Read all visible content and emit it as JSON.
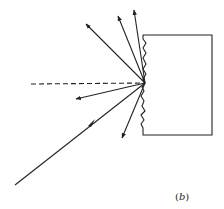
{
  "figure": {
    "label": "(b)",
    "label_open": "(",
    "label_letter": "b",
    "label_close": ")",
    "ink_color": "#222222",
    "background_color": "#ffffff"
  },
  "elements": {
    "incident_ray": "incident ray",
    "normal_line": "surface normal (dashed)",
    "surface_block": "rough-surfaced block",
    "scattered_rays_count": 5
  }
}
